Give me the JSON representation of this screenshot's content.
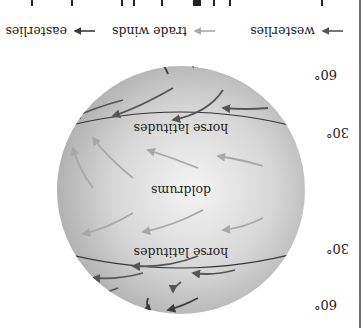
{
  "figure": {
    "title_fragment": "",
    "legend": [
      {
        "label": "easterlies",
        "color": "#3a3a3a"
      },
      {
        "label": "trade winds",
        "color": "#a8a8a8"
      },
      {
        "label": "westerlies",
        "color": "#555555"
      }
    ],
    "latitude_labels": {
      "north_60": "60°",
      "north_30": "30°",
      "south_30": "30°",
      "south_60": "60°"
    },
    "zone_labels": {
      "north_horse": "horse latitudes",
      "doldrums": "doldrums",
      "south_horse": "horse latitudes"
    },
    "orientation": "rotated 180°"
  }
}
